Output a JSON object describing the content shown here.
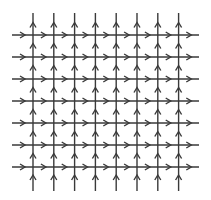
{
  "diagram": {
    "type": "vector-field-grid",
    "background": "#ffffff",
    "stroke_color": "#3a3a3a",
    "stroke_width": 1.4,
    "vertical_lines": {
      "count": 8,
      "x": [
        33,
        53.8,
        74.6,
        95.4,
        116.2,
        137,
        157.8,
        178.6
      ],
      "y_start": 13,
      "y_end": 191,
      "arrow_direction": "up"
    },
    "horizontal_lines": {
      "count": 7,
      "y": [
        35,
        57,
        79,
        101,
        123,
        145,
        167
      ],
      "x_start": 12,
      "x_end": 199,
      "arrow_direction": "right"
    },
    "arrowhead": {
      "style": "open-chevron",
      "half_width": 3,
      "length": 5
    }
  }
}
